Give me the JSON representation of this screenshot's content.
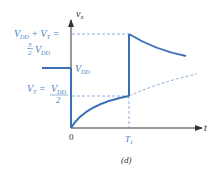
{
  "figure": {
    "caption": "(d)",
    "y_axis_label_main": "v",
    "y_axis_label_sub": "x",
    "x_axis_label": "t",
    "origin_label": "0",
    "t1_label_main": "T",
    "t1_label_sub": "1",
    "levels": {
      "top_line1": "V",
      "top_line1_sub1": "DD",
      "top_line1_plus": " + V",
      "top_line1_sub2": "T",
      "top_line1_eq": " =",
      "top_frac_num": "3",
      "top_frac_den": "2",
      "top_line2_v": "V",
      "top_line2_sub": "DD",
      "vdd_v": "V",
      "vdd_sub": "DD",
      "vt_v": "V",
      "vt_sub": "T",
      "vt_eq": " = ",
      "vt_num_v": "V",
      "vt_num_sub": "DD",
      "vt_den": "2"
    },
    "colors": {
      "curve": "#3a6fb8",
      "label": "#4a7fc1",
      "axis": "#333333",
      "dashed": "#6f9bd4"
    }
  }
}
